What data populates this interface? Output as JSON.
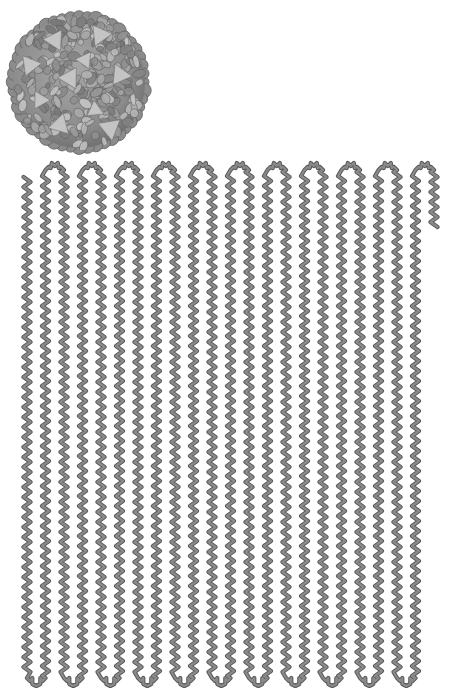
{
  "figure": {
    "colors": {
      "background": "#ffffff",
      "strand_fill": "#8a8a8a",
      "strand_outline": "#5a5a5a",
      "capsid_base": "#8c8c8c",
      "capsid_light": "#c4c4c4",
      "capsid_dark": "#5e5e5e"
    },
    "capsid": {
      "cx": 79,
      "cy": 82,
      "r": 68
    },
    "genome_strand": {
      "columns": 23,
      "first_column_x": 27,
      "column_spacing": 18.5,
      "top_y": 172,
      "bottom_y": 676,
      "start_y": 177,
      "end_y": 228,
      "zigzag_amplitude": 3.5,
      "zigzag_period": 10,
      "top_loops": 11,
      "bottom_loops": 11
    }
  }
}
